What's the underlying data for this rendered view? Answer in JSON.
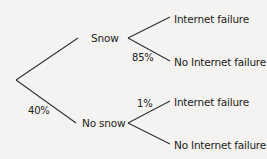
{
  "diagram": {
    "type": "probability-tree",
    "line_color": "#333333",
    "background": "#f4f3f1",
    "root": {
      "branches": [
        {
          "label": "Snow",
          "probability": "",
          "children": [
            {
              "label": "Internet failure",
              "probability": ""
            },
            {
              "label": "No Internet failure",
              "probability": "85%"
            }
          ]
        },
        {
          "label": "No snow",
          "probability": "40%",
          "children": [
            {
              "label": "Internet failure",
              "probability": "1%"
            },
            {
              "label": "No Internet failure",
              "probability": ""
            }
          ]
        }
      ]
    }
  },
  "labels": {
    "snow": "Snow",
    "no_snow": "No snow",
    "snow_internet_failure": "Internet failure",
    "snow_no_internet_failure": "No Internet failure",
    "nosnow_internet_failure": "Internet failure",
    "nosnow_no_internet_failure": "No Internet failure",
    "pct_no_snow": "40%",
    "pct_snow_no_failure": "85%",
    "pct_nosnow_failure": "1%"
  }
}
